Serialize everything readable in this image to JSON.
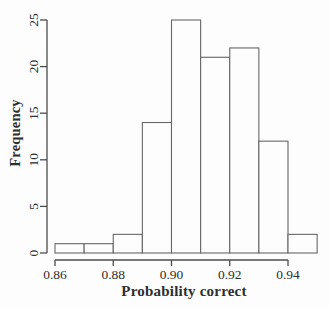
{
  "figure": {
    "background": "#fdfdfd"
  },
  "chart_data": {
    "type": "bar",
    "subtype": "histogram",
    "title": "",
    "xlabel": "Probability correct",
    "ylabel": "Frequency",
    "bin_edges": [
      0.86,
      0.87,
      0.88,
      0.89,
      0.9,
      0.91,
      0.92,
      0.93,
      0.94,
      0.95
    ],
    "counts": [
      1,
      1,
      2,
      14,
      25,
      21,
      22,
      12,
      2
    ],
    "x_tick_labels": [
      "0.86",
      "0.88",
      "0.90",
      "0.92",
      "0.94"
    ],
    "x_tick_values": [
      0.86,
      0.88,
      0.9,
      0.92,
      0.94
    ],
    "y_tick_labels": [
      "0",
      "5",
      "10",
      "15",
      "20",
      "25"
    ],
    "y_tick_values": [
      0,
      5,
      10,
      15,
      20,
      25
    ],
    "xlim": [
      0.86,
      0.95
    ],
    "ylim": [
      0,
      25
    ],
    "x_axis_line_range": [
      0.86,
      0.94
    ],
    "grid": false,
    "legend": null,
    "y_tick_label_rotation_deg": -90,
    "bar_fill": "#fdfdfd",
    "bar_stroke": "#676767",
    "axis_color": "#4c4c4c",
    "text_color": "#2e2e2e"
  }
}
